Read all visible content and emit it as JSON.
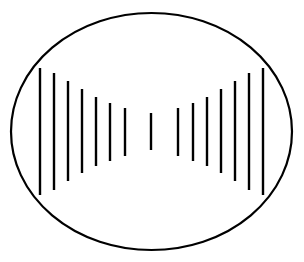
{
  "figure": {
    "background_color": "#ffffff",
    "stroke_color": "#000000",
    "canvas": {
      "width": 304,
      "height": 262
    }
  },
  "ellipse": {
    "name": "outline-ellipse",
    "cx": 151.5,
    "cy": 131.5,
    "rx": 140.5,
    "ry": 118.5,
    "stroke_color": "#000000",
    "stroke_width": 2.2,
    "fill": "none"
  },
  "chart_data": {
    "type": "bar",
    "subtitle": "Fifteen vertical segments of varying length, centered vertically, forming an hourglass (bowtie) profile",
    "xlabel": "",
    "ylabel": "",
    "grid": false,
    "legend": false,
    "axis_center_y": 131.5,
    "xlim": [
      11,
      292
    ],
    "ylim": [
      13,
      250
    ],
    "categories": [
      "1",
      "2",
      "3",
      "4",
      "5",
      "6",
      "7",
      "8",
      "9",
      "10",
      "11",
      "12",
      "13",
      "14",
      "15"
    ],
    "x": [
      40,
      54,
      68,
      82,
      96,
      110,
      125,
      151,
      178,
      193,
      207,
      221,
      235,
      249,
      263
    ],
    "values": [
      127,
      117,
      100,
      84,
      69,
      58,
      48,
      37,
      48,
      58,
      69,
      84,
      100,
      117,
      127
    ],
    "series": [
      {
        "name": "line length (px)",
        "values": [
          127,
          117,
          100,
          84,
          69,
          58,
          48,
          37,
          48,
          58,
          69,
          84,
          100,
          117,
          127
        ]
      }
    ],
    "annotations": []
  },
  "lines": [
    {
      "name": "vertical-line-1",
      "x": 40,
      "y1": 68,
      "y2": 195,
      "width": 2.4
    },
    {
      "name": "vertical-line-2",
      "x": 54,
      "y1": 73,
      "y2": 190,
      "width": 2.4
    },
    {
      "name": "vertical-line-3",
      "x": 68,
      "y1": 81,
      "y2": 181,
      "width": 2.4
    },
    {
      "name": "vertical-line-4",
      "x": 82,
      "y1": 89,
      "y2": 173,
      "width": 2.4
    },
    {
      "name": "vertical-line-5",
      "x": 96,
      "y1": 97,
      "y2": 166,
      "width": 2.4
    },
    {
      "name": "vertical-line-6",
      "x": 110,
      "y1": 103,
      "y2": 161,
      "width": 2.4
    },
    {
      "name": "vertical-line-7",
      "x": 125,
      "y1": 108,
      "y2": 156,
      "width": 2.4
    },
    {
      "name": "vertical-line-8",
      "x": 151,
      "y1": 113,
      "y2": 150,
      "width": 2.4
    },
    {
      "name": "vertical-line-9",
      "x": 178,
      "y1": 108,
      "y2": 156,
      "width": 2.4
    },
    {
      "name": "vertical-line-10",
      "x": 193,
      "y1": 103,
      "y2": 161,
      "width": 2.4
    },
    {
      "name": "vertical-line-11",
      "x": 207,
      "y1": 97,
      "y2": 166,
      "width": 2.4
    },
    {
      "name": "vertical-line-12",
      "x": 221,
      "y1": 89,
      "y2": 173,
      "width": 2.4
    },
    {
      "name": "vertical-line-13",
      "x": 235,
      "y1": 81,
      "y2": 181,
      "width": 2.4
    },
    {
      "name": "vertical-line-14",
      "x": 249,
      "y1": 73,
      "y2": 190,
      "width": 2.4
    },
    {
      "name": "vertical-line-15",
      "x": 263,
      "y1": 68,
      "y2": 195,
      "width": 2.4
    }
  ]
}
